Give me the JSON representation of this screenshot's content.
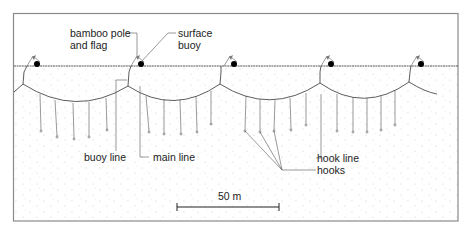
{
  "diagram": {
    "type": "longline fishing gear schematic",
    "labels": {
      "bamboo_pole_line1": "bamboo pole",
      "bamboo_pole_line2": "and flag",
      "surface_buoy_line1": "surface",
      "surface_buoy_line2": "buoy",
      "buoy_line": "buoy line",
      "main_line": "main line",
      "hook_line": "hook line",
      "hooks": "hooks",
      "scale": "50 m"
    },
    "colors": {
      "frame": "#8a8a8a",
      "line": "#333333",
      "buoy": "#000000",
      "stipple": "#bdbdbd",
      "background": "#ffffff"
    },
    "buoy_count": 5,
    "hook_lines_per_basket": 5
  }
}
